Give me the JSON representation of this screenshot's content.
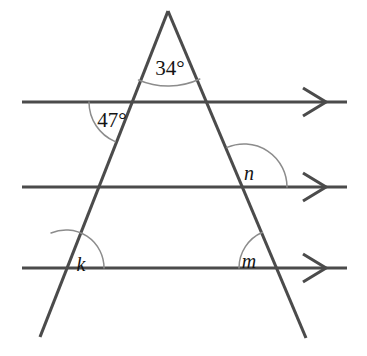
{
  "figure": {
    "type": "geometry-diagram",
    "background_color": "#ffffff",
    "line_color": "#4b4b4b",
    "arc_color": "#8c8c8c",
    "label_color": "#141414"
  },
  "labels": {
    "apex_angle": "34°",
    "upper_left_angle": "47°",
    "right_middle_angle": "n",
    "left_lower_angle": "k",
    "right_lower_angle": "m"
  },
  "geometry": {
    "apex": {
      "x": 168,
      "y": 11
    },
    "left_leg": {
      "x1": 168,
      "y1": 11,
      "x2": 40,
      "y2": 337
    },
    "right_leg": {
      "x1": 168,
      "y1": 11,
      "x2": 306,
      "y2": 338
    },
    "parallel_lines": [
      {
        "name": "line-top",
        "y": 102,
        "x1": 22,
        "x2": 347
      },
      {
        "name": "line-middle",
        "y": 187,
        "x1": 22,
        "x2": 347
      },
      {
        "name": "line-bottom",
        "y": 268,
        "x1": 22,
        "x2": 347
      }
    ],
    "arrow_heads": [
      {
        "name": "arrow-top",
        "tip_x": 325,
        "y": 102
      },
      {
        "name": "arrow-middle",
        "tip_x": 325,
        "y": 187
      },
      {
        "name": "arrow-bottom",
        "tip_x": 325,
        "y": 268
      }
    ],
    "intersections": {
      "left_leg_top_line": {
        "x": 132,
        "y": 102
      },
      "right_leg_top_line": {
        "x": 205,
        "y": 102
      },
      "left_leg_middle_line": {
        "x": 98,
        "y": 187
      },
      "right_leg_middle_line": {
        "x": 244,
        "y": 187
      },
      "left_leg_bottom_line": {
        "x": 66,
        "y": 268
      },
      "right_leg_bottom_line": {
        "x": 278,
        "y": 268
      }
    },
    "arcs": {
      "apex_arc": {
        "cx": 168,
        "cy": 11,
        "r": 75
      },
      "upper_left_arc": {
        "cx": 132,
        "cy": 102,
        "r": 43
      },
      "right_middle_arc": {
        "cx": 244,
        "cy": 187,
        "r": 43
      },
      "left_lower_arc": {
        "cx": 66,
        "cy": 268,
        "r": 38
      },
      "right_lower_arc": {
        "cx": 278,
        "cy": 268,
        "r": 39
      }
    },
    "label_positions": {
      "apex_angle": {
        "x": 170,
        "y": 70
      },
      "upper_left_angle": {
        "x": 112,
        "y": 122
      },
      "right_middle_angle": {
        "x": 249,
        "y": 174
      },
      "left_lower_angle": {
        "x": 80,
        "y": 265
      },
      "right_lower_angle": {
        "x": 249,
        "y": 262
      }
    }
  }
}
